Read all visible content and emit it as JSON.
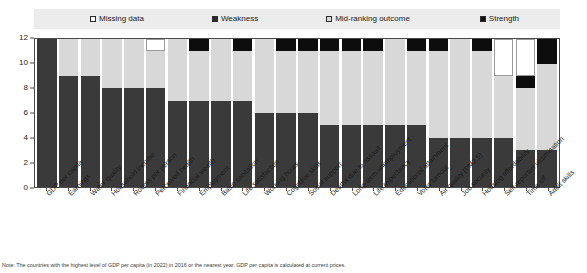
{
  "legend": {
    "items": [
      {
        "label": "Missing data",
        "swatch": "missing-data-swatch",
        "color": "#ffffff"
      },
      {
        "label": "Weakness",
        "swatch": "weakness-swatch",
        "color": "#2b2b2b"
      },
      {
        "label": "Mid-ranking outcome",
        "swatch": "mid-ranking-outcome-swatch",
        "color": "#d9d9d9"
      },
      {
        "label": "Strength",
        "swatch": "strength-swatch",
        "color": "#101010"
      }
    ]
  },
  "caption": {
    "text": "Note: The countries with the highest level of GDP per capita (in 2022) in 2016 or the nearest year. GDP per capita is calculated at current prices."
  },
  "chart_data": {
    "type": "bar",
    "title": "",
    "xlabel": "",
    "ylabel": "",
    "ylim": [
      0,
      12
    ],
    "yticks": [
      0,
      2,
      4,
      6,
      8,
      10,
      12
    ],
    "grid": false,
    "stacked": true,
    "legend_position": "top",
    "legend": [
      "Missing data",
      "Weakness",
      "Mid-ranking outcome",
      "Strength"
    ],
    "categories": [
      "GDP per capita",
      "Earnings",
      "Water quality",
      "Household income",
      "Rooms per person",
      "Perceived health",
      "Financial wealth",
      "Employment",
      "Basic sanitation",
      "Life satisfaction",
      "Working hours",
      "Cognitive skills",
      "Social support",
      "Deaths due to assault",
      "Long-term unemployment",
      "Life expectancy",
      "Educational attainment",
      "Voter turnout",
      "Air quality (PM2.5)",
      "Job security",
      "Housing affordability",
      "Self-reported victimisation",
      "Time off",
      "Adult skills"
    ],
    "series": [
      {
        "name": "Weakness",
        "values": [
          12,
          9,
          9,
          8,
          8,
          8,
          7,
          7,
          7,
          7,
          6,
          6,
          6,
          5,
          5,
          5,
          5,
          5,
          4,
          4,
          4,
          4,
          3,
          3
        ]
      },
      {
        "name": "Mid-ranking outcome",
        "values": [
          0,
          3,
          3,
          4,
          4,
          3,
          5,
          4,
          5,
          4,
          6,
          5,
          5,
          6,
          6,
          6,
          7,
          6,
          7,
          8,
          7,
          5,
          5,
          7
        ]
      },
      {
        "name": "Strength",
        "values": [
          0,
          0,
          0,
          0,
          0,
          0,
          0,
          1,
          0,
          1,
          0,
          1,
          1,
          1,
          1,
          1,
          0,
          1,
          1,
          0,
          1,
          0,
          1,
          2
        ]
      },
      {
        "name": "Missing data",
        "values": [
          0,
          0,
          0,
          0,
          0,
          1,
          0,
          0,
          0,
          0,
          0,
          0,
          0,
          0,
          0,
          0,
          0,
          0,
          0,
          0,
          0,
          3,
          3,
          0
        ]
      }
    ],
    "stack_order": [
      "Weakness",
      "Mid-ranking outcome",
      "Strength",
      "Missing data"
    ]
  }
}
